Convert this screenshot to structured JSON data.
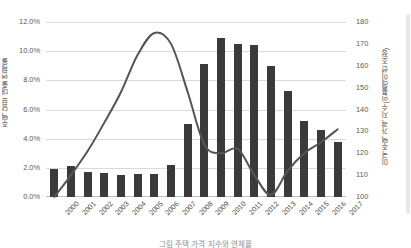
{
  "chart_data": {
    "type": "bar",
    "title": "",
    "subtitle": "",
    "xlabel": "",
    "categories": [
      "2000",
      "2001",
      "2002",
      "2003",
      "2004",
      "2005",
      "2006",
      "2007",
      "2008",
      "2009",
      "2010",
      "2011",
      "2012",
      "2013",
      "2014",
      "2015",
      "2016",
      "2017"
    ],
    "grid": true,
    "legend": "none",
    "series": [
      {
        "name": "주택 담보 대출 연체율",
        "type": "bar",
        "axis": "left",
        "color": "#3a3a3a",
        "unit": "%",
        "values": [
          1.9,
          2.1,
          1.7,
          1.65,
          1.5,
          1.55,
          1.6,
          2.2,
          5.0,
          9.1,
          10.9,
          10.5,
          10.4,
          9.0,
          7.3,
          5.2,
          4.6,
          3.8
        ]
      },
      {
        "name": "미국 주택 가격 지수(인플레이션 조정)",
        "type": "line",
        "axis": "right",
        "color": "#555555",
        "unit": "",
        "values": [
          100,
          110,
          121,
          134,
          148,
          165,
          175,
          170,
          148,
          124,
          120,
          122,
          110,
          101,
          112,
          120,
          125,
          131
        ]
      }
    ],
    "yaxis_left": {
      "label": "주택 담보 대출 연체율",
      "ticks": [
        "0.0%",
        "2.0%",
        "4.0%",
        "6.0%",
        "8.0%",
        "10.0%",
        "12.0%"
      ],
      "min": 0,
      "max": 12,
      "step": 2
    },
    "yaxis_right": {
      "label": "미국 주택 가격 지수(인플레이션 조정)",
      "ticks": [
        "100",
        "110",
        "120",
        "130",
        "140",
        "150",
        "160",
        "170",
        "180"
      ],
      "min": 100,
      "max": 180,
      "step": 10
    },
    "colors": {
      "bar": "#3a3a3a",
      "line": "#555555",
      "grid": "#d9d9d9",
      "text": "#4f4f4f",
      "background": "#ffffff"
    }
  },
  "caption": {
    "text": "그림 주택 가격 지수와 연체율"
  }
}
